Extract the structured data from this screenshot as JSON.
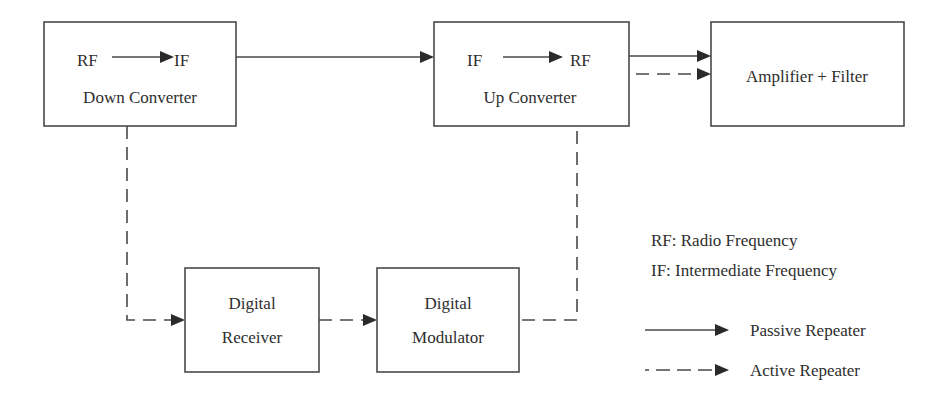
{
  "diagram": {
    "blocks": {
      "down_converter": {
        "from": "RF",
        "to": "IF",
        "label": "Down Converter"
      },
      "up_converter": {
        "from": "IF",
        "to": "RF",
        "label": "Up Converter"
      },
      "amplifier": {
        "label": "Amplifier + Filter"
      },
      "digital_receiver": {
        "line1": "Digital",
        "line2": "Receiver"
      },
      "digital_modulator": {
        "line1": "Digital",
        "line2": "Modulator"
      }
    },
    "legend": {
      "abbrev": [
        {
          "text": "RF: Radio Frequency"
        },
        {
          "text": "IF: Intermediate Frequency"
        }
      ],
      "lines": [
        {
          "style": "solid",
          "label": "Passive Repeater"
        },
        {
          "style": "dashed",
          "label": "Active Repeater"
        }
      ]
    },
    "connections": [
      {
        "from": "Down Converter",
        "to": "Up Converter",
        "style": "solid"
      },
      {
        "from": "Up Converter",
        "to": "Amplifier + Filter",
        "style": "solid"
      },
      {
        "from": "Up Converter",
        "to": "Amplifier + Filter",
        "style": "dashed"
      },
      {
        "from": "Down Converter",
        "to": "Digital Receiver",
        "style": "dashed"
      },
      {
        "from": "Digital Receiver",
        "to": "Digital Modulator",
        "style": "dashed"
      },
      {
        "from": "Digital Modulator",
        "to": "Up Converter",
        "style": "dashed"
      }
    ],
    "colors": {
      "stroke": "#4a4a4a",
      "text": "#2e2e2e",
      "background": "#ffffff"
    }
  }
}
